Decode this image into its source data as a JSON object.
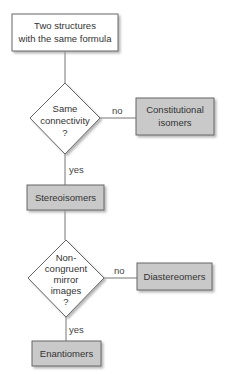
{
  "diagram": {
    "colors": {
      "start_fill": "#ffffff",
      "process_fill": "#c9c9c9",
      "decision_fill": "#ffffff",
      "stroke": "#666666",
      "shadow": "#bdbdbd",
      "text": "#333333"
    },
    "nodes": {
      "start": {
        "type": "start",
        "lines": [
          "Two structures",
          "with the same formula"
        ]
      },
      "decision1": {
        "type": "decision",
        "lines": [
          "Same",
          "connectivity",
          "?"
        ]
      },
      "constitutional": {
        "type": "result",
        "lines": [
          "Constitutional",
          "isomers"
        ]
      },
      "stereoisomers": {
        "type": "process",
        "lines": [
          "Stereoisomers"
        ]
      },
      "decision2": {
        "type": "decision",
        "lines": [
          "Non-",
          "congruent",
          "mirror",
          "images",
          "?"
        ]
      },
      "diastereomers": {
        "type": "result",
        "lines": [
          "Diastereomers"
        ]
      },
      "enantiomers": {
        "type": "result",
        "lines": [
          "Enantiomers"
        ]
      }
    },
    "edges": [
      {
        "from": "start",
        "to": "decision1",
        "label": ""
      },
      {
        "from": "decision1",
        "to": "constitutional",
        "label": "no"
      },
      {
        "from": "decision1",
        "to": "stereoisomers",
        "label": "yes"
      },
      {
        "from": "stereoisomers",
        "to": "decision2",
        "label": ""
      },
      {
        "from": "decision2",
        "to": "diastereomers",
        "label": "no"
      },
      {
        "from": "decision2",
        "to": "enantiomers",
        "label": "yes"
      }
    ]
  }
}
